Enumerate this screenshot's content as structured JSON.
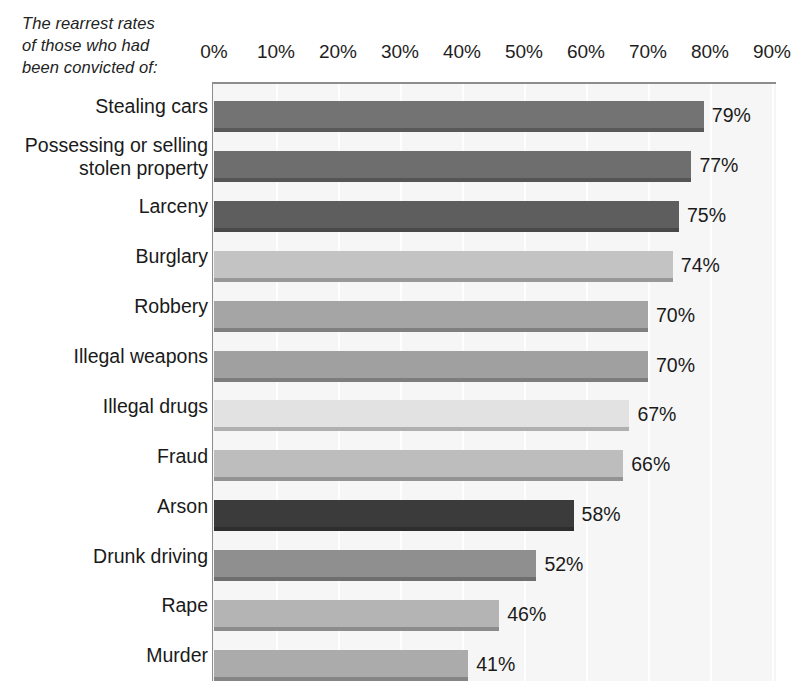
{
  "caption": {
    "lines": [
      "The rearrest rates",
      "of those who had",
      "been convicted of:"
    ]
  },
  "chart_data": {
    "type": "bar",
    "orientation": "horizontal",
    "title": "The rearrest rates of those who had been convicted of:",
    "xlabel": "",
    "ylabel": "",
    "xlim": [
      0,
      90
    ],
    "xticks": [
      0,
      10,
      20,
      30,
      40,
      50,
      60,
      70,
      80,
      90
    ],
    "xtick_labels": [
      "0%",
      "10%",
      "20%",
      "30%",
      "40%",
      "50%",
      "60%",
      "70%",
      "80%",
      "90%"
    ],
    "grid": "vertical-white",
    "legend": "none",
    "value_suffix": "%",
    "categories": [
      "Stealing cars",
      "Possessing or selling stolen property",
      "Larceny",
      "Burglary",
      "Robbery",
      "Illegal weapons",
      "Illegal drugs",
      "Fraud",
      "Arson",
      "Drunk driving",
      "Rape",
      "Murder"
    ],
    "values": [
      79,
      77,
      75,
      74,
      70,
      70,
      67,
      66,
      58,
      52,
      46,
      41
    ],
    "value_labels": [
      "79%",
      "77%",
      "75%",
      "74%",
      "70%",
      "70%",
      "67%",
      "66%",
      "58%",
      "52%",
      "46%",
      "41%"
    ],
    "bar_colors": [
      "#737373",
      "#6e6e6e",
      "#5e5e5e",
      "#c3c3c3",
      "#a5a5a5",
      "#a0a0a0",
      "#e2e2e2",
      "#bdbdbd",
      "#3b3b3b",
      "#8f8f8f",
      "#b4b4b4",
      "#ababab"
    ],
    "category_label_lines": [
      [
        "Stealing cars"
      ],
      [
        "Possessing or selling",
        "stolen property"
      ],
      [
        "Larceny"
      ],
      [
        "Burglary"
      ],
      [
        "Robbery"
      ],
      [
        "Illegal weapons"
      ],
      [
        "Illegal drugs"
      ],
      [
        "Fraud"
      ],
      [
        "Arson"
      ],
      [
        "Drunk driving"
      ],
      [
        "Rape"
      ],
      [
        "Murder"
      ]
    ],
    "plot_background": "#f6f6f6",
    "axis_color": "#8d8d8d"
  }
}
